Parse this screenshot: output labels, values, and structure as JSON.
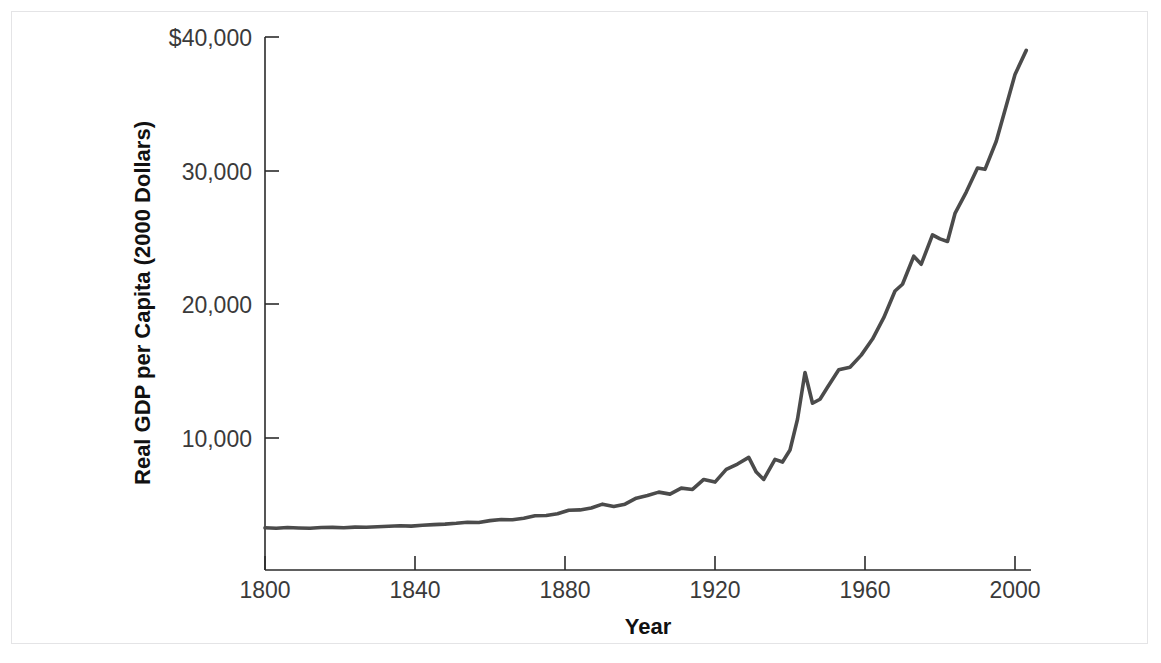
{
  "figure": {
    "border_color": "#e4e4e6",
    "background": "#ffffff"
  },
  "chart_data": {
    "type": "line",
    "title": "",
    "subtitle": "",
    "xlabel": "Year",
    "ylabel": "Real GDP per Capita (2000 Dollars)",
    "xlim": [
      1800,
      2005
    ],
    "ylim": [
      0,
      42000
    ],
    "xticks": [
      1800,
      1840,
      1880,
      1920,
      1960,
      2000
    ],
    "xtick_labels": [
      "1800",
      "1840",
      "1880",
      "1920",
      "1960",
      "2000"
    ],
    "yticks": [
      10000,
      20000,
      30000,
      40000
    ],
    "ytick_labels": [
      "10,000",
      "20,000",
      "30,000",
      "$40,000"
    ],
    "grid": false,
    "legend": null,
    "line_color": "#4b4b4b",
    "line_width": 3.6,
    "annotations": [],
    "series": [
      {
        "name": "Real GDP per Capita",
        "x": [
          1800,
          1803,
          1806,
          1809,
          1812,
          1815,
          1818,
          1821,
          1824,
          1827,
          1830,
          1833,
          1836,
          1839,
          1842,
          1845,
          1848,
          1851,
          1854,
          1857,
          1860,
          1863,
          1866,
          1869,
          1872,
          1875,
          1878,
          1881,
          1884,
          1887,
          1890,
          1893,
          1896,
          1899,
          1902,
          1905,
          1908,
          1911,
          1914,
          1917,
          1920,
          1923,
          1926,
          1929,
          1931,
          1933,
          1936,
          1938,
          1940,
          1942,
          1944,
          1946,
          1948,
          1950,
          1953,
          1956,
          1959,
          1962,
          1965,
          1968,
          1970,
          1973,
          1975,
          1978,
          1980,
          1982,
          1984,
          1987,
          1990,
          1992,
          1995,
          1998,
          2000,
          2003
        ],
        "values": [
          3280,
          3250,
          3300,
          3270,
          3250,
          3300,
          3310,
          3290,
          3330,
          3320,
          3360,
          3400,
          3430,
          3410,
          3470,
          3520,
          3560,
          3620,
          3700,
          3680,
          3820,
          3900,
          3880,
          4000,
          4180,
          4200,
          4330,
          4600,
          4620,
          4760,
          5050,
          4880,
          5050,
          5500,
          5700,
          5950,
          5800,
          6250,
          6150,
          6900,
          6700,
          7650,
          8050,
          8550,
          7450,
          6900,
          8400,
          8200,
          9100,
          11400,
          14900,
          12600,
          12900,
          13800,
          15100,
          15300,
          16200,
          17400,
          19000,
          21000,
          21500,
          23600,
          23000,
          25200,
          24900,
          24700,
          26800,
          28400,
          30200,
          30100,
          32200,
          35200,
          37200,
          39000
        ]
      }
    ]
  }
}
